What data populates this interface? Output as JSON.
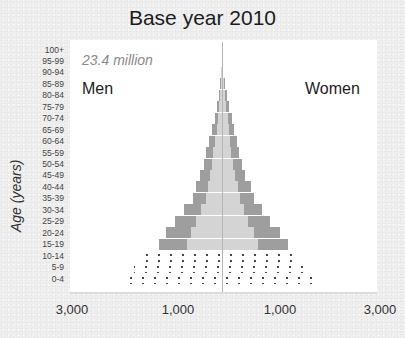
{
  "chart_data": {
    "type": "bar",
    "subtype": "population-pyramid",
    "title": "Base year 2010",
    "annotation": "23.4 million",
    "ylabel": "Age (years)",
    "xlabel": "",
    "x_tick_labels": [
      "3,000",
      "1,000",
      "1,000",
      "3,000"
    ],
    "x_units": "thousands",
    "legend": {
      "left": "Men",
      "right": "Women"
    },
    "categories": [
      "100+",
      "95-99",
      "90-94",
      "85-89",
      "80-84",
      "75-79",
      "70-74",
      "65-69",
      "60-64",
      "55-59",
      "50-54",
      "45-49",
      "40-44",
      "35-39",
      "30-34",
      "25-29",
      "20-24",
      "15-19",
      "10-14",
      "5-9",
      "0-4"
    ],
    "series": [
      {
        "name": "Men",
        "values": [
          0,
          5,
          15,
          35,
          60,
          100,
          140,
          190,
          250,
          300,
          350,
          420,
          500,
          560,
          730,
          900,
          1080,
          1210,
          1550,
          1700,
          1870
        ]
      },
      {
        "name": "Women",
        "values": [
          0,
          5,
          20,
          50,
          90,
          140,
          190,
          230,
          280,
          330,
          380,
          450,
          560,
          610,
          770,
          920,
          1120,
          1270,
          1480,
          1640,
          1800
        ]
      }
    ],
    "dotted_categories": [
      "10-14",
      "5-9",
      "0-4"
    ],
    "grid": false,
    "xlim": [
      -3000,
      3000
    ]
  },
  "ui": {
    "title": "Base year 2010",
    "total": "23.4 million",
    "men_label": "Men",
    "women_label": "Women",
    "y_axis_label": "Age (years)",
    "x_ticks": [
      "3,000",
      "1,000",
      "1,000",
      "3,000"
    ],
    "age_groups": [
      "100+",
      "95-99",
      "90-94",
      "85-89",
      "80-84",
      "75-79",
      "70-74",
      "65-69",
      "60-64",
      "55-59",
      "50-54",
      "45-49",
      "40-44",
      "35-39",
      "30-34",
      "25-29",
      "20-24",
      "15-19",
      "10-14",
      "5-9",
      "0-4"
    ]
  },
  "colors": {
    "bar_outer": "#9e9e9e",
    "bar_inner": "#d4d4d4",
    "dots": "#333333",
    "panel": "#ffffff",
    "background": "#eeeeee"
  }
}
